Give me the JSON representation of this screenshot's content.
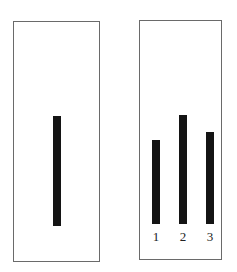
{
  "panels": [
    {
      "name": "left-panel",
      "box": {
        "left": 13,
        "top": 21,
        "width": 87,
        "height": 241
      },
      "bars": [
        {
          "left": 53,
          "top": 116,
          "width": 8,
          "height": 110
        }
      ],
      "labels": []
    },
    {
      "name": "right-panel",
      "box": {
        "left": 139,
        "top": 20,
        "width": 83,
        "height": 240
      },
      "bars": [
        {
          "left": 152,
          "top": 140,
          "width": 8,
          "height": 84
        },
        {
          "left": 179,
          "top": 115,
          "width": 8,
          "height": 109
        },
        {
          "left": 206,
          "top": 132,
          "width": 8,
          "height": 92
        }
      ],
      "labels": [
        "1",
        "2",
        "3"
      ]
    }
  ],
  "colors": {
    "border": "#6a6a6a",
    "bar": "#141414",
    "background": "#ffffff"
  }
}
